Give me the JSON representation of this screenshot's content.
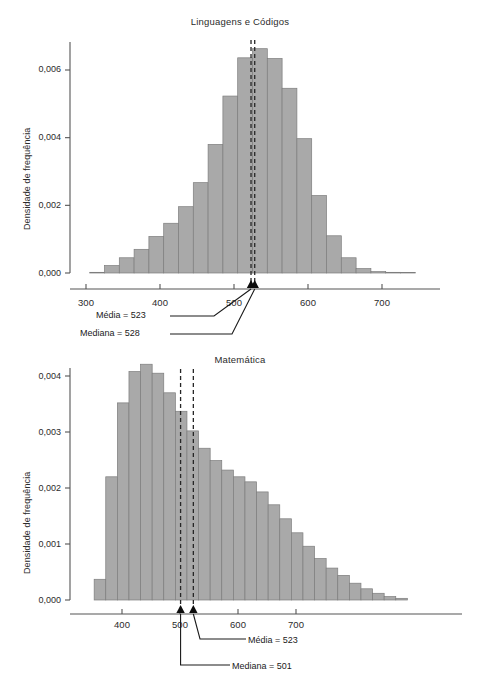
{
  "figure": {
    "background": "#ffffff",
    "bar_fill": "#a9a9a9",
    "bar_stroke": "#7d7d7d",
    "axis_color": "#555555",
    "dash_color": "#262626"
  },
  "chart_data": [
    {
      "type": "bar",
      "id": "linguagens-e-codigos",
      "title": "Linguagens e Códigos",
      "xlabel": "",
      "ylabel": "Densidade de frequência",
      "xlim": [
        295,
        750
      ],
      "ylim": [
        0,
        0.0068
      ],
      "grid": false,
      "legend": "none",
      "xticks": [
        300,
        400,
        500,
        600,
        700
      ],
      "xticklabels": [
        "300",
        "400",
        "500",
        "600",
        "700"
      ],
      "yticks": [
        0.0,
        0.002,
        0.004,
        0.006
      ],
      "yticklabels": [
        "0,000",
        "0,002",
        "0,004",
        "0,006"
      ],
      "bin_width": 20,
      "bin_starts": [
        305,
        325,
        345,
        365,
        385,
        405,
        425,
        445,
        465,
        485,
        505,
        525,
        545,
        565,
        585,
        605,
        625,
        645,
        665,
        685,
        705,
        725
      ],
      "values": [
        2e-05,
        0.00022,
        0.00045,
        0.0007,
        0.00108,
        0.00147,
        0.00196,
        0.00267,
        0.0038,
        0.00523,
        0.00636,
        0.00663,
        0.00634,
        0.00546,
        0.00397,
        0.00229,
        0.0011,
        0.00045,
        0.00013,
        4e-05,
        2e-05,
        1e-05
      ],
      "annotations": [
        {
          "label": "Média = 523",
          "value": 523,
          "stat": "mean"
        },
        {
          "label": "Mediana = 528",
          "value": 528,
          "stat": "median"
        }
      ]
    },
    {
      "type": "bar",
      "id": "matematica",
      "title": "Matemática",
      "xlabel": "",
      "ylabel": "Densidade de frequência",
      "xlim": [
        348,
        900
      ],
      "ylim": [
        0,
        0.00435
      ],
      "grid": false,
      "legend": "none",
      "xticks": [
        400,
        500,
        600,
        700
      ],
      "xticklabels": [
        "400",
        "500",
        "600",
        "700"
      ],
      "yticks": [
        0.0,
        0.001,
        0.002,
        0.003,
        0.004
      ],
      "yticklabels": [
        "0,000",
        "0,001",
        "0,002",
        "0,003",
        "0,004"
      ],
      "bin_width": 20,
      "bin_starts": [
        352,
        372,
        392,
        412,
        432,
        452,
        472,
        492,
        512,
        532,
        552,
        572,
        592,
        612,
        632,
        652,
        672,
        692,
        712,
        732,
        752,
        772,
        792,
        812,
        832,
        852,
        872
      ],
      "values": [
        0.00037,
        0.0022,
        0.00352,
        0.00408,
        0.00421,
        0.00405,
        0.0037,
        0.00337,
        0.00302,
        0.00271,
        0.00249,
        0.00232,
        0.0022,
        0.00211,
        0.00193,
        0.0017,
        0.00145,
        0.0012,
        0.00096,
        0.00074,
        0.00057,
        0.00044,
        0.0003,
        0.0002,
        0.00012,
        6e-05,
        3e-05
      ],
      "annotations": [
        {
          "label": "Média = 523",
          "value": 523,
          "stat": "mean"
        },
        {
          "label": "Mediana = 501",
          "value": 501,
          "stat": "median"
        }
      ]
    }
  ],
  "panels": {
    "top": {
      "title": "Linguagens e Códigos",
      "ylabel": "Densidade de frequência",
      "yticklabels": [
        "0,006",
        "0,004",
        "0,002",
        "0,000"
      ],
      "xticklabels": [
        "300",
        "400",
        "500",
        "600",
        "700"
      ],
      "annot_mean": "Média = 523",
      "annot_median": "Mediana = 528"
    },
    "bottom": {
      "title": "Matemática",
      "ylabel": "Densidade de frequência",
      "yticklabels": [
        "0,004",
        "0,003",
        "0,002",
        "0,001",
        "0,000"
      ],
      "xticklabels": [
        "400",
        "500",
        "600",
        "700"
      ],
      "annot_mean": "Média = 523",
      "annot_median": "Mediana = 501"
    }
  }
}
